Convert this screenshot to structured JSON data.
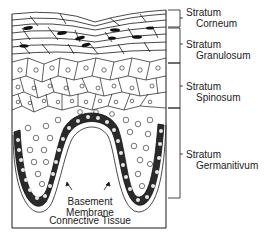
{
  "diagram": {
    "type": "epidermis-cross-section",
    "layers": [
      {
        "line1": "Stratum",
        "line2": "Corneum"
      },
      {
        "line1": "Stratum",
        "line2": "Granulosum"
      },
      {
        "line1": "Stratum",
        "line2": "Spinosum"
      },
      {
        "line1": "Stratum",
        "line2": "Germanitivum"
      }
    ],
    "annotations": {
      "basement_line1": "Basement",
      "basement_line2": "Membrane",
      "connective": "Connective Tissue"
    },
    "colors": {
      "line": "#1a1a1a",
      "background": "#ffffff",
      "nucleus": "#111111"
    }
  }
}
